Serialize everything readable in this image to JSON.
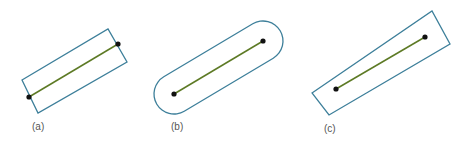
{
  "figure": {
    "colors": {
      "outline": "#3d7f9a",
      "segment": "#5d7a25",
      "endpoint": "#111111",
      "label": "#555555"
    },
    "panels": [
      {
        "id": "a",
        "label": "(a)",
        "shape": "rectangle-perpendicular-ends",
        "outline_points": [
          [
            22,
            80
          ],
          [
            108,
            29
          ],
          [
            127,
            62
          ],
          [
            38,
            113
          ]
        ],
        "segment": {
          "p1": [
            29,
            97
          ],
          "p2": [
            118,
            44
          ]
        },
        "label_pos": [
          32,
          122
        ]
      },
      {
        "id": "b",
        "label": "(b)",
        "shape": "capsule-rounded-ends",
        "segment": {
          "p1": [
            174,
            94
          ],
          "p2": [
            263,
            41
          ]
        },
        "radius": 20,
        "label_pos": [
          171,
          122
        ]
      },
      {
        "id": "c",
        "label": "(c)",
        "shape": "rectangle-extended-ends",
        "outline_points": [
          [
            312,
            93
          ],
          [
            432,
            11
          ],
          [
            450,
            44
          ],
          [
            329,
            115
          ]
        ],
        "segment": {
          "p1": [
            336,
            89
          ],
          "p2": [
            425,
            37
          ]
        },
        "label_pos": [
          324,
          124
        ]
      }
    ]
  }
}
